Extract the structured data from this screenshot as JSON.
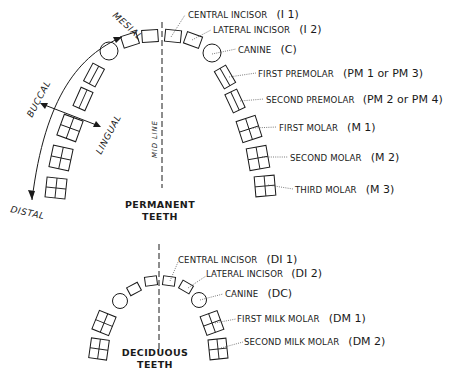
{
  "permanent": {
    "title_line1": "PERMANENT",
    "title_line2": "TEETH",
    "labels": [
      {
        "name": "CENTRAL INCISOR",
        "code": "(I 1)"
      },
      {
        "name": "LATERAL INCISOR",
        "code": "(I 2)"
      },
      {
        "name": "CANINE",
        "code": "(C)"
      },
      {
        "name": "FIRST PREMOLAR",
        "code": "(PM 1 or PM 3)"
      },
      {
        "name": "SECOND PREMOLAR",
        "code": "(PM 2 or PM 4)"
      },
      {
        "name": "FIRST MOLAR",
        "code": "(M 1)"
      },
      {
        "name": "SECOND MOLAR",
        "code": "(M 2)"
      },
      {
        "name": "THIRD MOLAR",
        "code": "(M 3)"
      }
    ]
  },
  "deciduous": {
    "title_line1": "DECIDUOUS",
    "title_line2": "TEETH",
    "labels": [
      {
        "name": "CENTRAL INCISOR",
        "code": "(DI 1)"
      },
      {
        "name": "LATERAL INCISOR",
        "code": "(DI 2)"
      },
      {
        "name": "CANINE",
        "code": "(DC)"
      },
      {
        "name": "FIRST MILK MOLAR",
        "code": "(DM 1)"
      },
      {
        "name": "SECOND MILK MOLAR",
        "code": "(DM 2)"
      }
    ]
  },
  "directions": {
    "mesial": "MESIAL",
    "distal": "DISTAL",
    "buccal": "BUCCAL",
    "lingual": "LINGUAL",
    "midline": "MID LINE"
  }
}
